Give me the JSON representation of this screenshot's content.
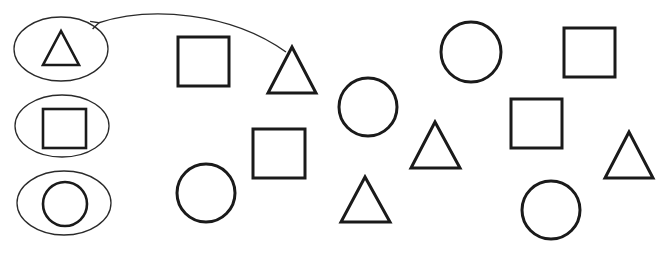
{
  "diagram": {
    "width": 670,
    "height": 253,
    "colors": {
      "stroke": "#1a1a1a",
      "background": "#ffffff"
    },
    "categories": [
      {
        "name": "triangle",
        "ellipse": {
          "cx": 61,
          "cy": 49,
          "rx": 47,
          "ry": 32
        }
      },
      {
        "name": "square",
        "ellipse": {
          "cx": 62,
          "cy": 126,
          "rx": 47,
          "ry": 31
        }
      },
      {
        "name": "circle",
        "ellipse": {
          "cx": 64,
          "cy": 203,
          "rx": 47,
          "ry": 32
        }
      }
    ],
    "arrow": {
      "from": "triangle-1",
      "to": "category-triangle",
      "description": "curved arrow from triangle to triangle category ellipse"
    },
    "shapes": [
      {
        "id": "square-1",
        "type": "square",
        "x": 178,
        "y": 37,
        "size": 50
      },
      {
        "id": "triangle-1",
        "type": "triangle",
        "apex": [
          292,
          47
        ],
        "base_y": 93,
        "base_x": [
          268,
          316
        ]
      },
      {
        "id": "circle-1",
        "type": "circle",
        "cx": 368,
        "cy": 107,
        "r": 29
      },
      {
        "id": "circle-2",
        "type": "circle",
        "cx": 471,
        "cy": 52,
        "r": 30
      },
      {
        "id": "square-2",
        "type": "square",
        "x": 564,
        "y": 28,
        "size": 50
      },
      {
        "id": "square-3",
        "type": "square",
        "x": 253,
        "y": 129,
        "size": 50
      },
      {
        "id": "square-4",
        "type": "square",
        "x": 511,
        "y": 99,
        "size": 50
      },
      {
        "id": "triangle-2",
        "type": "triangle",
        "apex": [
          435,
          122
        ],
        "base_y": 168,
        "base_x": [
          411,
          460
        ]
      },
      {
        "id": "triangle-3",
        "type": "triangle",
        "apex": [
          629,
          132
        ],
        "base_y": 178,
        "base_x": [
          605,
          653
        ]
      },
      {
        "id": "circle-3",
        "type": "circle",
        "cx": 206,
        "cy": 193,
        "r": 29
      },
      {
        "id": "triangle-4",
        "type": "triangle",
        "apex": [
          365,
          177
        ],
        "base_y": 222,
        "base_x": [
          341,
          390
        ]
      },
      {
        "id": "circle-4",
        "type": "circle",
        "cx": 551,
        "cy": 210,
        "r": 29
      }
    ],
    "counts": {
      "triangles": 4,
      "squares": 4,
      "circles": 4
    }
  }
}
